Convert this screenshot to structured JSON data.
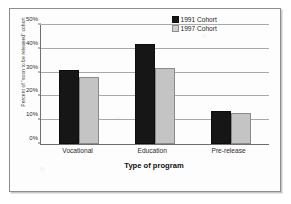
{
  "chart_data": {
    "type": "bar",
    "title": "",
    "categories": [
      "Vocational",
      "Education",
      "Pre-release"
    ],
    "series": [
      {
        "name": "1991 Cohort",
        "values": [
          31,
          28,
          14
        ],
        "color": "#161616"
      },
      {
        "name": "1997 Cohort",
        "values": [
          28,
          32,
          13
        ],
        "color": "#c4c4c4"
      }
    ],
    "grouped_values": {
      "Vocational": {
        "1991 Cohort": 31,
        "1997 Cohort": 28
      },
      "Education": {
        "1991 Cohort": 42,
        "1997 Cohort": 32
      },
      "Pre-release": {
        "1991 Cohort": 14,
        "1997 Cohort": 13
      }
    },
    "xlabel": "Type of program",
    "ylabel": "Percent of \"soon to be released\" cohort",
    "ylim": [
      0,
      50
    ],
    "ytick_values": [
      0,
      10,
      20,
      30,
      40,
      50
    ],
    "ytick_labels": [
      "0%",
      "10%",
      "20%",
      "30%",
      "40%",
      "50%"
    ],
    "grid": "horizontal",
    "legend_position": "top-right-inside"
  },
  "axes": {
    "y_title": "Percent of \"soon to be released\" cohort",
    "x_title": "Type of program",
    "y_ticks": [
      "50%",
      "40%",
      "30%",
      "20%",
      "10%",
      "0%"
    ],
    "x_ticks": [
      "Vocational",
      "Education",
      "Pre-release"
    ]
  },
  "legend": {
    "entries": [
      {
        "label": "1991 Cohort",
        "color": "#161616"
      },
      {
        "label": "1997 Cohort",
        "color": "#cfcfcf"
      }
    ]
  },
  "bars": [
    {
      "category": "Vocational",
      "series": "1991 Cohort",
      "value": 31
    },
    {
      "category": "Vocational",
      "series": "1997 Cohort",
      "value": 28
    },
    {
      "category": "Education",
      "series": "1991 Cohort",
      "value": 42
    },
    {
      "category": "Education",
      "series": "1997 Cohort",
      "value": 32
    },
    {
      "category": "Pre-release",
      "series": "1991 Cohort",
      "value": 14
    },
    {
      "category": "Pre-release",
      "series": "1997 Cohort",
      "value": 13
    }
  ]
}
